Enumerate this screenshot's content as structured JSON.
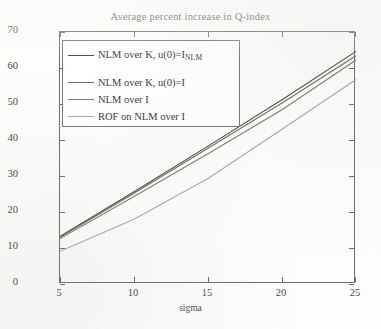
{
  "chart_data": {
    "type": "line",
    "title": "Average percent increase in Q-index",
    "xlabel": "sigma",
    "ylabel": "percent increase in Q-index",
    "xlim": [
      5,
      25
    ],
    "ylim": [
      0,
      70
    ],
    "xticks": [
      "5",
      "10",
      "15",
      "20",
      "25"
    ],
    "yticks": [
      "0",
      "10",
      "20",
      "30",
      "40",
      "50",
      "60",
      "70"
    ],
    "grid": false,
    "legend_position": "upper left",
    "x": [
      5,
      10,
      15,
      20,
      25
    ],
    "series": [
      {
        "name": "NLM over K, u(0)=I_NLM",
        "label_main": "NLM over K, u(0)=I",
        "label_sub": "NLM",
        "color": "#4a4a46",
        "values": [
          13.2,
          25.6,
          38.3,
          51.2,
          64.6
        ]
      },
      {
        "name": "NLM over K, u(0)=I",
        "label_main": "NLM over K, u(0)=I",
        "label_sub": "",
        "color": "#6b6b66",
        "values": [
          13.0,
          25.2,
          37.7,
          50.3,
          63.4
        ]
      },
      {
        "name": "NLM over I",
        "label_main": "NLM over I",
        "label_sub": "",
        "color": "#7d7d77",
        "values": [
          12.6,
          24.3,
          36.2,
          48.4,
          62.2
        ]
      },
      {
        "name": "ROF on NLM over I",
        "label_main": "ROF on NLM over I",
        "label_sub": "",
        "color": "#a9a9a3",
        "values": [
          9.1,
          18.0,
          29.3,
          43.0,
          56.8
        ]
      }
    ]
  }
}
